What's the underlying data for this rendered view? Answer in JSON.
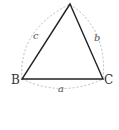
{
  "diagram": {
    "type": "triangle",
    "vertices": [
      {
        "id": "A",
        "label": "",
        "x": 70,
        "y": 4
      },
      {
        "id": "B",
        "label": "B",
        "x": 22,
        "y": 79
      },
      {
        "id": "C",
        "label": "C",
        "x": 103,
        "y": 79
      }
    ],
    "sides": [
      {
        "id": "a",
        "label": "a",
        "from": "B",
        "to": "C"
      },
      {
        "id": "b",
        "label": "b",
        "from": "A",
        "to": "C"
      },
      {
        "id": "c",
        "label": "c",
        "from": "A",
        "to": "B"
      }
    ],
    "colors": {
      "triangle_stroke": "#222222",
      "arc_stroke": "#aaaaaa",
      "label_color": "#333333"
    }
  }
}
